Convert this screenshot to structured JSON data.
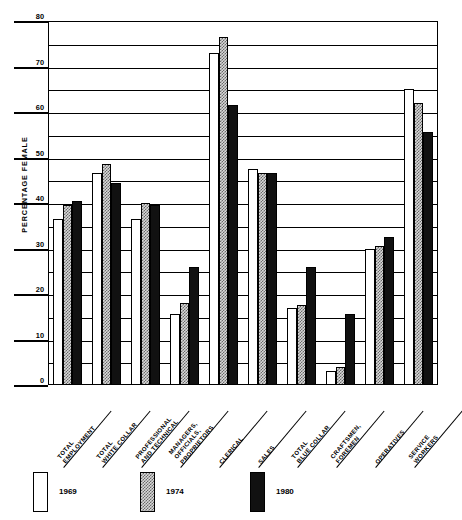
{
  "chart_data": {
    "type": "bar",
    "title": "",
    "xlabel": "",
    "ylabel": "PERCENTAGE FEMALE",
    "ylim": [
      0,
      80
    ],
    "ytick_step": 10,
    "gridline_step": 5,
    "grid": true,
    "legend_position": "bottom",
    "categories": [
      "TOTAL EMPLOYMENT",
      "TOTAL WHITE COLLAR",
      "PROFESSIONAL AND TECHNICAL",
      "MANAGERS, OFFICIALS, PROPRIETORS",
      "CLERICAL",
      "SALES",
      "TOTAL BLUE COLLAR",
      "CRAFTSMEN, FOREMEN",
      "OPERATIVES",
      "SERVICE WORKERS"
    ],
    "category_lines": [
      [
        "TOTAL",
        "EMPLOYMENT"
      ],
      [
        "TOTAL",
        "WHITE COLLAR"
      ],
      [
        "PROFESSIONAL",
        "AND TECHNICAL"
      ],
      [
        "MANAGERS,",
        "OFFICIALS,",
        "PROPRIETORS"
      ],
      [
        "CLERICAL"
      ],
      [
        "SALES"
      ],
      [
        "TOTAL",
        "BLUE COLLAR"
      ],
      [
        "CRAFTSMEN,",
        "FOREMEN"
      ],
      [
        "OPERATIVES"
      ],
      [
        "SERVICE",
        "WORKERS"
      ]
    ],
    "series": [
      {
        "name": "1969",
        "fill": "white",
        "color": "#ffffff",
        "values": [
          36.5,
          46.5,
          36.5,
          15.5,
          73.0,
          47.5,
          17.0,
          3.0,
          30.0,
          65.0
        ]
      },
      {
        "name": "1974",
        "fill": "checkered",
        "color": "#d8d8d8",
        "values": [
          39.5,
          48.5,
          40.0,
          18.0,
          76.5,
          46.5,
          17.5,
          4.0,
          30.5,
          62.0
        ]
      },
      {
        "name": "1980",
        "fill": "solid",
        "color": "#111111",
        "values": [
          40.5,
          44.5,
          39.5,
          26.0,
          61.5,
          46.5,
          26.0,
          15.5,
          32.5,
          55.5
        ]
      }
    ],
    "ytick_labels": [
      "0",
      "10",
      "20",
      "30",
      "40",
      "50",
      "60",
      "70",
      "80"
    ],
    "ytick_values": [
      0,
      10,
      20,
      30,
      40,
      50,
      60,
      70,
      80
    ]
  },
  "legend": {
    "items": [
      {
        "label": "1969",
        "swatch": "white-swatch"
      },
      {
        "label": "1974",
        "swatch": "checkered-swatch"
      },
      {
        "label": "1980",
        "swatch": "black-swatch"
      }
    ]
  }
}
